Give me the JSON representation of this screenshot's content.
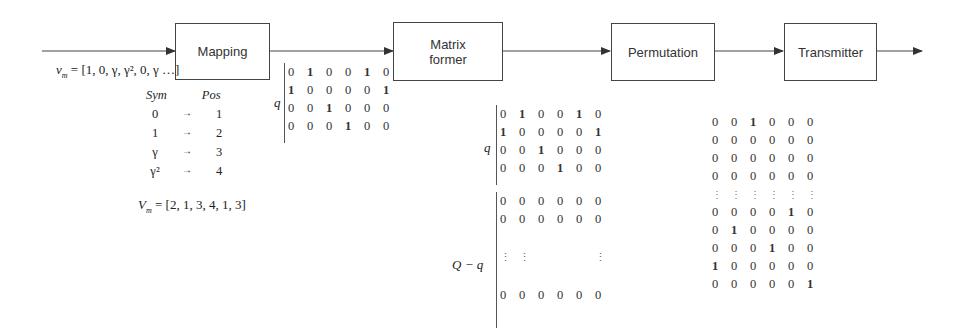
{
  "blocks": [
    {
      "id": "mapping",
      "label": "Mapping"
    },
    {
      "id": "matrix_former",
      "label": "Matrix\nformer",
      "line1": "Matrix",
      "line2": "former"
    },
    {
      "id": "permutation",
      "label": "Permutation"
    },
    {
      "id": "transmitter",
      "label": "Transmitter"
    }
  ],
  "input": {
    "vector_label": "v",
    "vector_sub": "m",
    "vector_value": "= [1, 0, γ, γ², 0, γ …]"
  },
  "mapping_table": {
    "headers": [
      "Sym",
      "Pos"
    ],
    "rows": [
      {
        "sym": "0",
        "arrow": "→",
        "pos": "1"
      },
      {
        "sym": "1",
        "arrow": "→",
        "pos": "2"
      },
      {
        "sym": "γ",
        "arrow": "→",
        "pos": "3"
      },
      {
        "sym": "γ²",
        "arrow": "→",
        "pos": "4"
      }
    ]
  },
  "output_vector": {
    "label": "V",
    "sub": "m",
    "value": "= [2, 1, 3, 4, 1, 3]"
  },
  "matrix_q": {
    "brace_label": "q",
    "rows": [
      [
        "0",
        "1",
        "0",
        "0",
        "1",
        "0"
      ],
      [
        "1",
        "0",
        "0",
        "0",
        "0",
        "1"
      ],
      [
        "0",
        "0",
        "1",
        "0",
        "0",
        "0"
      ],
      [
        "0",
        "0",
        "0",
        "1",
        "0",
        "0"
      ]
    ]
  },
  "matrix_full": {
    "top_brace_label": "q",
    "bottom_brace_label": "Q − q",
    "top_rows": [
      [
        "0",
        "1",
        "0",
        "0",
        "1",
        "0"
      ],
      [
        "1",
        "0",
        "0",
        "0",
        "0",
        "1"
      ],
      [
        "0",
        "0",
        "1",
        "0",
        "0",
        "0"
      ],
      [
        "0",
        "0",
        "0",
        "1",
        "0",
        "0"
      ]
    ],
    "bottom_rows": [
      [
        "0",
        "0",
        "0",
        "0",
        "0",
        "0"
      ],
      [
        "0",
        "0",
        "0",
        "0",
        "0",
        "0"
      ],
      [
        "⋮",
        "⋮",
        "",
        "",
        "",
        "⋮"
      ],
      [
        "0",
        "0",
        "0",
        "0",
        "0",
        "0"
      ]
    ]
  },
  "matrix_permuted": {
    "rows": [
      [
        "0",
        "0",
        "1",
        "0",
        "0",
        "0"
      ],
      [
        "0",
        "0",
        "0",
        "0",
        "0",
        "0"
      ],
      [
        "0",
        "0",
        "0",
        "0",
        "0",
        "0"
      ],
      [
        "0",
        "0",
        "0",
        "0",
        "0",
        "0"
      ],
      [
        "⋮",
        "⋮",
        "⋮",
        "⋮",
        "⋮",
        "⋮"
      ],
      [
        "0",
        "0",
        "0",
        "0",
        "1",
        "0"
      ],
      [
        "0",
        "1",
        "0",
        "0",
        "0",
        "0"
      ],
      [
        "0",
        "0",
        "0",
        "1",
        "0",
        "0"
      ],
      [
        "1",
        "0",
        "0",
        "0",
        "0",
        "0"
      ],
      [
        "0",
        "0",
        "0",
        "0",
        "0",
        "1"
      ]
    ]
  }
}
